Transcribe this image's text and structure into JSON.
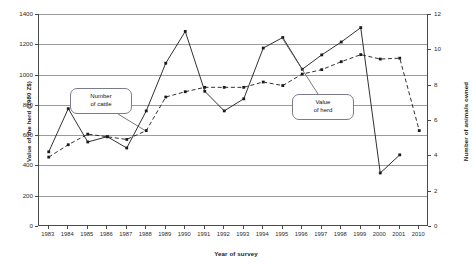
{
  "chart_data": {
    "type": "line",
    "title": "",
    "xlabel": "Year of survey",
    "ylabel": "Value of the herd (1980 Z$)",
    "ylabel_right": "Number of animals owned",
    "categories": [
      "1983",
      "1984",
      "1985",
      "1986",
      "1987",
      "1988",
      "1989",
      "1990",
      "1991",
      "1992",
      "1993",
      "1994",
      "1995",
      "1996",
      "1997",
      "1998",
      "1999",
      "2000",
      "2001",
      "2010"
    ],
    "ylim": [
      0,
      1400
    ],
    "yticks": [
      0,
      200,
      400,
      600,
      800,
      1000,
      1200,
      1400
    ],
    "ylim_right": [
      0,
      12
    ],
    "yticks_right": [
      0,
      2,
      4,
      6,
      8,
      10,
      12
    ],
    "grid": true,
    "legend_position": "annotations",
    "series": [
      {
        "name": "Value of herd",
        "axis": "left",
        "style": "solid",
        "marker": "square",
        "color": "#1a1a1a",
        "values": [
          490,
          775,
          555,
          590,
          515,
          760,
          1075,
          1285,
          890,
          760,
          840,
          1175,
          1245,
          1035,
          1130,
          1215,
          1310,
          350,
          470,
          null
        ]
      },
      {
        "name": "Number of cattle",
        "axis": "right",
        "style": "dashed",
        "marker": "square",
        "color": "#1a1a1a",
        "values": [
          3.9,
          4.6,
          5.2,
          5.05,
          4.9,
          5.4,
          7.3,
          7.6,
          7.85,
          7.85,
          7.85,
          8.15,
          7.95,
          8.6,
          8.85,
          9.3,
          9.7,
          9.45,
          9.5,
          5.4
        ]
      }
    ],
    "annotations": [
      {
        "id": "cattle",
        "line1": "Number",
        "line2": "of cattle"
      },
      {
        "id": "value",
        "line1": "Value",
        "line2": "of herd"
      }
    ]
  }
}
